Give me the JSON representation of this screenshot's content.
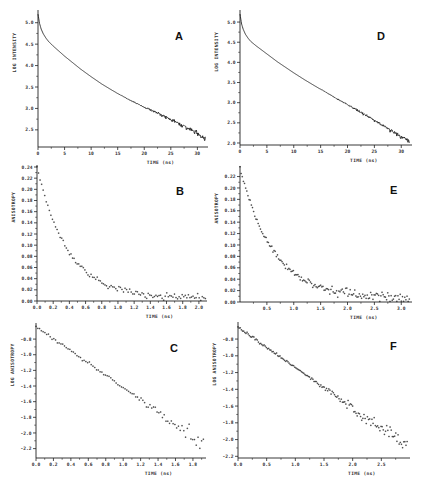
{
  "figure": {
    "panels_order": [
      "A",
      "D",
      "B",
      "E",
      "C",
      "F"
    ]
  },
  "chart_data": [
    {
      "panel": "A",
      "type": "line",
      "title": "",
      "panel_label": "A",
      "xlabel": "TIME (ns)",
      "ylabel": "LOG INTENSITY",
      "xlim": [
        0,
        32
      ],
      "ylim": [
        2.1,
        5.25
      ],
      "xticks": [
        0,
        5,
        10,
        15,
        20,
        25,
        30
      ],
      "xtick_labels": [
        "0",
        "5",
        "10",
        "15",
        "20",
        "25",
        "30"
      ],
      "yticks": [
        2.5,
        3.0,
        3.5,
        4.0,
        4.5,
        5.0
      ],
      "ytick_labels": [
        "2.5",
        "3.0",
        "3.5",
        "4.0",
        "4.5",
        "5.0"
      ],
      "grid": false,
      "x": [
        0,
        0.3,
        0.6,
        1,
        1.5,
        2,
        3,
        4,
        5,
        6,
        7,
        8,
        9,
        10,
        12,
        14,
        16,
        18,
        20,
        22,
        24,
        26,
        28,
        30,
        31.5
      ],
      "y": [
        5.2,
        4.98,
        4.85,
        4.74,
        4.64,
        4.56,
        4.44,
        4.33,
        4.22,
        4.12,
        4.02,
        3.92,
        3.83,
        3.74,
        3.57,
        3.42,
        3.28,
        3.15,
        3.03,
        2.92,
        2.8,
        2.68,
        2.55,
        2.42,
        2.3
      ]
    },
    {
      "panel": "D",
      "type": "line",
      "title": "",
      "panel_label": "D",
      "xlabel": "TIME (ns)",
      "ylabel": "LOG INTENSITY",
      "xlim": [
        0,
        32
      ],
      "ylim": [
        1.95,
        5.25
      ],
      "xticks": [
        0,
        5,
        10,
        15,
        20,
        25,
        30
      ],
      "xtick_labels": [
        "0",
        "5",
        "10",
        "15",
        "20",
        "25",
        "30"
      ],
      "yticks": [
        2.0,
        2.5,
        3.0,
        3.5,
        4.0,
        4.5,
        5.0
      ],
      "ytick_labels": [
        "2.0",
        "2.5",
        "3.0",
        "3.5",
        "4.0",
        "4.5",
        "5.0"
      ],
      "grid": false,
      "x": [
        0,
        0.3,
        0.6,
        1,
        1.5,
        2,
        3,
        4,
        5,
        6,
        7,
        8,
        9,
        10,
        12,
        14,
        16,
        18,
        20,
        22,
        24,
        26,
        28,
        30,
        31.5
      ],
      "y": [
        5.2,
        4.95,
        4.82,
        4.7,
        4.6,
        4.52,
        4.41,
        4.31,
        4.21,
        4.11,
        4.01,
        3.92,
        3.83,
        3.74,
        3.57,
        3.41,
        3.26,
        3.1,
        2.95,
        2.8,
        2.64,
        2.48,
        2.32,
        2.15,
        2.05
      ]
    },
    {
      "panel": "B",
      "type": "scatter",
      "title": "",
      "panel_label": "B",
      "xlabel": "TIME (ns)",
      "ylabel": "ANISOTROPY",
      "xlim": [
        0,
        2.1
      ],
      "ylim": [
        0,
        0.24
      ],
      "xticks": [
        0.0,
        0.2,
        0.4,
        0.6,
        0.8,
        1.0,
        1.2,
        1.4,
        1.6,
        1.8,
        2.0
      ],
      "xtick_labels": [
        "0.0",
        "0.2",
        "0.4",
        "0.6",
        "0.8",
        "1.0",
        "1.2",
        "1.4",
        "1.6",
        "1.8",
        "2.0"
      ],
      "yticks": [
        0.0,
        0.02,
        0.04,
        0.06,
        0.08,
        0.1,
        0.12,
        0.14,
        0.16,
        0.18,
        0.2,
        0.22,
        0.24
      ],
      "ytick_labels": [
        "0.00",
        "0.02",
        "0.04",
        "0.06",
        "0.08",
        "0.10",
        "0.12",
        "0.14",
        "0.16",
        "0.18",
        "0.20",
        "0.22",
        "0.24"
      ],
      "grid": false,
      "model": {
        "a": 0.235,
        "tau": 0.38,
        "baseline": 0.005,
        "noise": 0.004,
        "n": 110,
        "x0": 0.0,
        "x1": 2.08
      }
    },
    {
      "panel": "E",
      "type": "scatter",
      "title": "",
      "panel_label": "E",
      "xlabel": "TIME (ns)",
      "ylabel": "ANISOTROPY",
      "xlim": [
        0,
        3.2
      ],
      "ylim": [
        0,
        0.235
      ],
      "xticks": [
        0.5,
        1.0,
        1.5,
        2.0,
        2.5,
        3.0
      ],
      "xtick_labels": [
        "0.5",
        "1.0",
        "1.5",
        "2.0",
        "2.5",
        "3.0"
      ],
      "yticks": [
        0.0,
        0.02,
        0.04,
        0.06,
        0.08,
        0.1,
        0.12,
        0.14,
        0.16,
        0.18,
        0.2,
        0.22
      ],
      "ytick_labels": [
        "0.00",
        "0.02",
        "0.04",
        "0.06",
        "0.08",
        "0.10",
        "0.12",
        "0.14",
        "0.16",
        "0.18",
        "0.20",
        "0.22"
      ],
      "grid": false,
      "model": {
        "a": 0.228,
        "tau": 0.62,
        "baseline": 0.006,
        "noise": 0.005,
        "n": 150,
        "x0": 0.0,
        "x1": 3.15
      }
    },
    {
      "panel": "C",
      "type": "scatter",
      "title": "",
      "panel_label": "C",
      "xlabel": "TIME (ns)",
      "ylabel": "LOG ANISOTROPY",
      "xlim": [
        0,
        1.95
      ],
      "ylim": [
        -2.32,
        -0.62
      ],
      "xticks": [
        0.0,
        0.2,
        0.4,
        0.6,
        0.8,
        1.0,
        1.2,
        1.4,
        1.6,
        1.8
      ],
      "xtick_labels": [
        "0.0",
        "0.2",
        "0.4",
        "0.6",
        "0.8",
        "1.0",
        "1.2",
        "1.4",
        "1.6",
        "1.8"
      ],
      "yticks": [
        -0.8,
        -1.0,
        -1.2,
        -1.4,
        -1.6,
        -1.8,
        -2.0,
        -2.2
      ],
      "ytick_labels": [
        "-0.8",
        "-1.0",
        "-1.2",
        "-1.4",
        "-1.6",
        "-1.8",
        "-2.0",
        "-2.2"
      ],
      "grid": false,
      "model": {
        "y0": -0.64,
        "slope": -0.78,
        "noise_start": 1.0,
        "noise": 0.09,
        "n": 95,
        "x0": 0.0,
        "x1": 1.92
      }
    },
    {
      "panel": "F",
      "type": "scatter",
      "title": "",
      "panel_label": "F",
      "xlabel": "TIME (ns)",
      "ylabel": "LOG ANISOTROPY",
      "xlim": [
        0,
        3.0
      ],
      "ylim": [
        -2.22,
        -0.62
      ],
      "xticks": [
        0.0,
        0.5,
        1.0,
        1.5,
        2.0,
        2.5
      ],
      "xtick_labels": [
        "0.0",
        "0.5",
        "1.0",
        "1.5",
        "2.0",
        "2.5"
      ],
      "yticks": [
        -0.8,
        -1.0,
        -1.2,
        -1.4,
        -1.6,
        -1.8,
        -2.0,
        -2.2
      ],
      "ytick_labels": [
        "-0.8",
        "-1.0",
        "-1.2",
        "-1.4",
        "-1.6",
        "-1.8",
        "-2.0",
        "-2.2"
      ],
      "grid": false,
      "model": {
        "y0": -0.66,
        "slope": -0.48,
        "noise_start": 1.0,
        "noise": 0.08,
        "n": 150,
        "x0": 0.0,
        "x1": 2.95
      }
    }
  ],
  "layout": {
    "panels": {
      "A": {
        "left": 38,
        "right": 208,
        "top": 12,
        "bottom": 147,
        "letter_x": 175,
        "letter_y": 40
      },
      "D": {
        "left": 240,
        "right": 412,
        "top": 12,
        "bottom": 145,
        "letter_x": 377,
        "letter_y": 40
      },
      "B": {
        "left": 37,
        "right": 207,
        "top": 167,
        "bottom": 301,
        "letter_x": 176,
        "letter_y": 195
      },
      "E": {
        "left": 240,
        "right": 412,
        "top": 168,
        "bottom": 302,
        "letter_x": 390,
        "letter_y": 194
      },
      "C": {
        "left": 36,
        "right": 206,
        "top": 325,
        "bottom": 458,
        "letter_x": 170,
        "letter_y": 352
      },
      "F": {
        "left": 238,
        "right": 410,
        "top": 324,
        "bottom": 458,
        "letter_x": 390,
        "letter_y": 350
      }
    }
  }
}
